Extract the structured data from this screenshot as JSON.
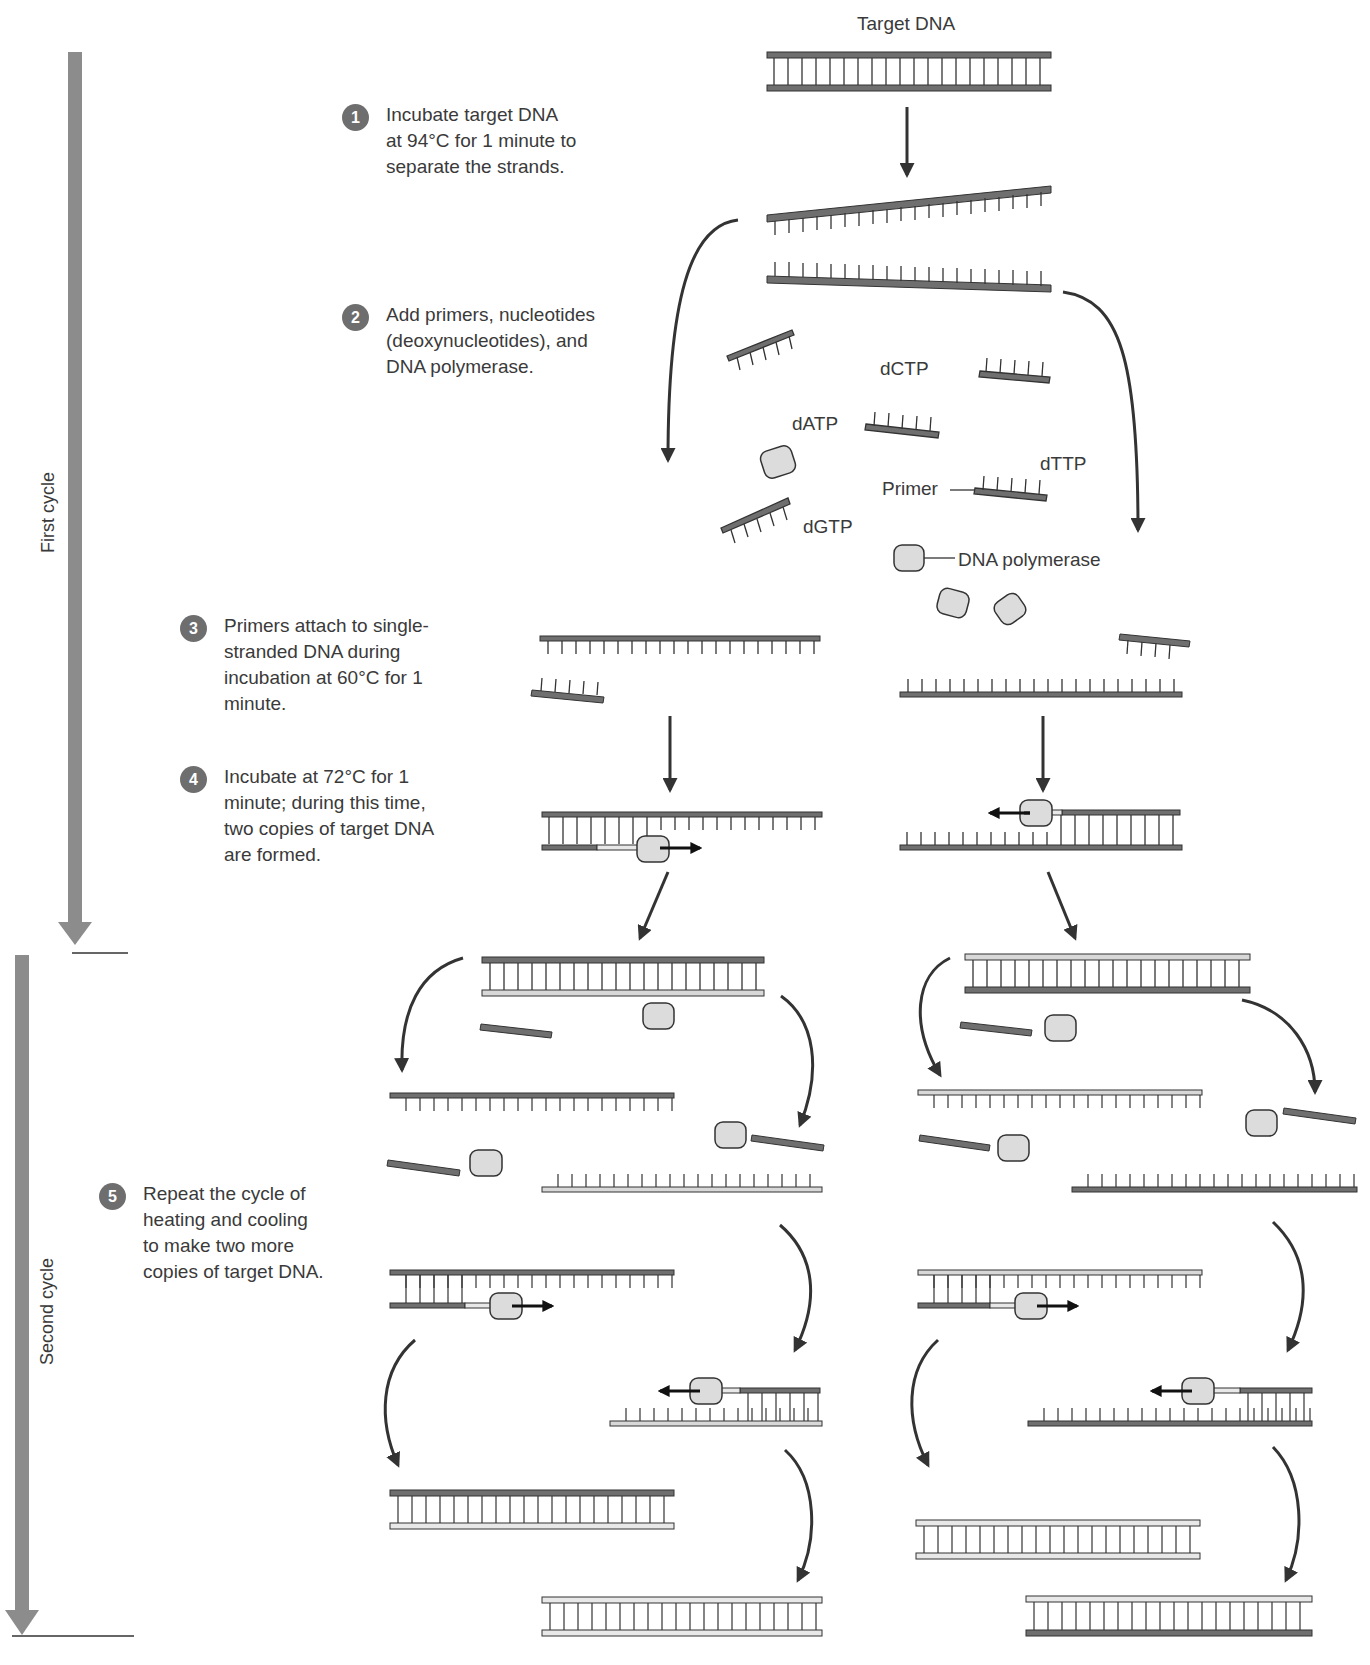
{
  "figure": {
    "title": "Target DNA",
    "cycles": {
      "first": "First cycle",
      "second": "Second cycle"
    },
    "steps": [
      {
        "number": "1",
        "lines": [
          "Incubate target DNA",
          "at 94°C for 1 minute to",
          "separate the strands."
        ]
      },
      {
        "number": "2",
        "lines": [
          "Add primers, nucleotides",
          "(deoxynucleotides), and",
          "DNA polymerase."
        ]
      },
      {
        "number": "3",
        "lines": [
          "Primers attach to single-",
          "stranded DNA during",
          "incubation at 60°C for 1",
          "minute."
        ]
      },
      {
        "number": "4",
        "lines": [
          "Incubate at 72°C for 1",
          "minute; during this time,",
          "two copies of target DNA",
          "are formed."
        ]
      },
      {
        "number": "5",
        "lines": [
          "Repeat the cycle of",
          "heating and cooling",
          "to make two more",
          "copies of target DNA."
        ]
      }
    ],
    "labels": {
      "dCTP": "dCTP",
      "dATP": "dATP",
      "dTTP": "dTTP",
      "dGTP": "dGTP",
      "primer": "Primer",
      "polymerase": "DNA polymerase"
    },
    "colors": {
      "dark_strand": "#6f6f6f",
      "light_strand": "#d8d8d8",
      "new_strand": "#e8e8e8",
      "arrow": "#333333",
      "cycle_bar": "#8c8c8c",
      "enzyme_fill": "#dcdcdc",
      "badge": "#6e6e6e"
    }
  }
}
